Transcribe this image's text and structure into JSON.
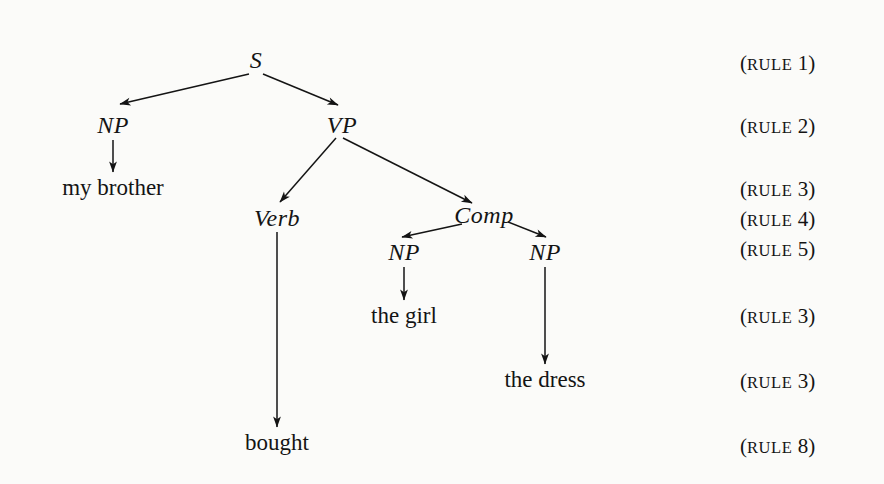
{
  "figure": {
    "type": "syntax-tree-diagram",
    "background_color": "#fbfbf9",
    "ink_color": "#141414"
  },
  "tree": {
    "nodes": [
      {
        "id": "s",
        "label": "S",
        "x": 256,
        "y": 60,
        "kind": "nonterminal"
      },
      {
        "id": "np1",
        "label": "NP",
        "x": 113,
        "y": 125,
        "kind": "nonterminal"
      },
      {
        "id": "vp",
        "label": "VP",
        "x": 342,
        "y": 125,
        "kind": "nonterminal"
      },
      {
        "id": "verb",
        "label": "Verb",
        "x": 277,
        "y": 218,
        "kind": "nonterminal"
      },
      {
        "id": "comp",
        "label": "Comp",
        "x": 484,
        "y": 215,
        "kind": "nonterminal"
      },
      {
        "id": "np2",
        "label": "NP",
        "x": 404,
        "y": 252,
        "kind": "nonterminal"
      },
      {
        "id": "np3",
        "label": "NP",
        "x": 545,
        "y": 252,
        "kind": "nonterminal"
      }
    ],
    "terminals": [
      {
        "id": "t-my-brother",
        "label": "my brother",
        "x": 113,
        "y": 188
      },
      {
        "id": "t-the-girl",
        "label": "the girl",
        "x": 404,
        "y": 316
      },
      {
        "id": "t-the-dress",
        "label": "the dress",
        "x": 545,
        "y": 380
      },
      {
        "id": "t-bought",
        "label": "bought",
        "x": 277,
        "y": 443
      }
    ],
    "edges": [
      {
        "from": "s",
        "to": "np1",
        "x1": 249,
        "y1": 74,
        "x2": 120,
        "y2": 104
      },
      {
        "from": "s",
        "to": "vp",
        "x1": 263,
        "y1": 74,
        "x2": 338,
        "y2": 105
      },
      {
        "from": "vp",
        "to": "verb",
        "x1": 336,
        "y1": 138,
        "x2": 280,
        "y2": 202
      },
      {
        "from": "vp",
        "to": "comp",
        "x1": 343,
        "y1": 138,
        "x2": 472,
        "y2": 203
      },
      {
        "from": "comp",
        "to": "np2",
        "x1": 462,
        "y1": 224,
        "x2": 402,
        "y2": 237
      },
      {
        "from": "comp",
        "to": "np3",
        "x1": 508,
        "y1": 222,
        "x2": 546,
        "y2": 237
      },
      {
        "from": "np1",
        "to": "t-my-brother",
        "x1": 113,
        "y1": 140,
        "x2": 113,
        "y2": 172
      },
      {
        "from": "np2",
        "to": "t-the-girl",
        "x1": 404,
        "y1": 267,
        "x2": 404,
        "y2": 300
      },
      {
        "from": "np3",
        "to": "t-the-dress",
        "x1": 545,
        "y1": 267,
        "x2": 545,
        "y2": 364
      },
      {
        "from": "verb",
        "to": "t-bought",
        "x1": 277,
        "y1": 232,
        "x2": 277,
        "y2": 427
      }
    ]
  },
  "rules": [
    {
      "id": "rule-1",
      "open": "(",
      "word": "rule",
      "number": "1",
      "close": ")",
      "x": 740,
      "y": 63
    },
    {
      "id": "rule-2",
      "open": "(",
      "word": "rule",
      "number": "2",
      "close": ")",
      "x": 740,
      "y": 126
    },
    {
      "id": "rule-3",
      "open": "(",
      "word": "rule",
      "number": "3",
      "close": ")",
      "x": 740,
      "y": 189
    },
    {
      "id": "rule-4",
      "open": "(",
      "word": "rule",
      "number": "4",
      "close": ")",
      "x": 740,
      "y": 219
    },
    {
      "id": "rule-5",
      "open": "(",
      "word": "rule",
      "number": "5",
      "close": ")",
      "x": 740,
      "y": 249
    },
    {
      "id": "rule-6",
      "open": "(",
      "word": "rule",
      "number": "3",
      "close": ")",
      "x": 740,
      "y": 316
    },
    {
      "id": "rule-7",
      "open": "(",
      "word": "rule",
      "number": "3",
      "close": ")",
      "x": 740,
      "y": 381
    },
    {
      "id": "rule-8",
      "open": "(",
      "word": "rule",
      "number": "8",
      "close": ")",
      "x": 740,
      "y": 446
    }
  ]
}
